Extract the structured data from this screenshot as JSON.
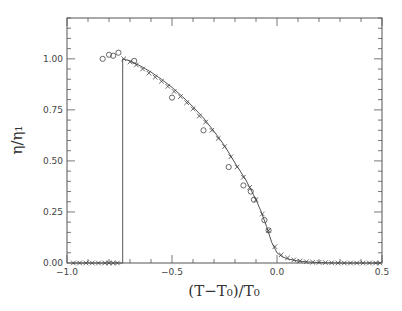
{
  "chart_data": {
    "type": "scatter",
    "title": "",
    "xlabel": "(T−T₀)/T₀",
    "ylabel": "η/η₁",
    "xlim": [
      -1.0,
      0.5
    ],
    "ylim": [
      0.0,
      1.2
    ],
    "grid": false,
    "x_ticks": [
      -1.0,
      -0.5,
      0.0,
      0.5
    ],
    "x_tick_labels": [
      "−1.0",
      "−0.5",
      "0.0",
      "0.5"
    ],
    "y_ticks": [
      0.0,
      0.25,
      0.5,
      0.75,
      1.0
    ],
    "y_tick_labels": [
      "0.00",
      "0.25",
      "0.50",
      "0.75",
      "1.00"
    ],
    "series": [
      {
        "name": "theory (line)",
        "style": "line",
        "x": [
          -0.97,
          -0.735,
          -0.735,
          -0.7,
          -0.65,
          -0.6,
          -0.55,
          -0.5,
          -0.45,
          -0.4,
          -0.35,
          -0.3,
          -0.25,
          -0.2,
          -0.15,
          -0.1,
          -0.075,
          -0.05,
          -0.025,
          0.0,
          0.025,
          0.05,
          0.1,
          0.15,
          0.2,
          0.3,
          0.4,
          0.49
        ],
        "y": [
          0.0,
          0.0,
          1.0,
          0.99,
          0.965,
          0.935,
          0.9,
          0.86,
          0.815,
          0.765,
          0.71,
          0.645,
          0.575,
          0.49,
          0.41,
          0.31,
          0.25,
          0.18,
          0.1,
          0.05,
          0.03,
          0.02,
          0.01,
          0.005,
          0.002,
          0.0,
          0.0,
          0.0
        ]
      },
      {
        "name": "simulation (crosses)",
        "style": "x",
        "x": [
          -0.97,
          -0.94,
          -0.91,
          -0.88,
          -0.85,
          -0.82,
          -0.8,
          -0.78,
          -0.76,
          -0.73,
          -0.7,
          -0.67,
          -0.64,
          -0.61,
          -0.58,
          -0.55,
          -0.52,
          -0.49,
          -0.46,
          -0.43,
          -0.4,
          -0.37,
          -0.34,
          -0.31,
          -0.28,
          -0.25,
          -0.22,
          -0.19,
          -0.16,
          -0.13,
          -0.1,
          -0.07,
          -0.04,
          -0.01,
          0.02,
          0.05,
          0.08,
          0.11,
          0.14,
          0.17,
          0.2,
          0.23,
          0.26,
          0.29,
          0.32,
          0.35,
          0.38,
          0.41,
          0.44,
          0.47,
          0.49
        ],
        "y": [
          0.0,
          0.0,
          0.0,
          0.0,
          0.0,
          0.0,
          0.0,
          0.0,
          0.0,
          1.0,
          0.985,
          0.97,
          0.95,
          0.93,
          0.91,
          0.89,
          0.865,
          0.84,
          0.815,
          0.785,
          0.755,
          0.72,
          0.69,
          0.65,
          0.61,
          0.57,
          0.52,
          0.47,
          0.42,
          0.37,
          0.31,
          0.24,
          0.16,
          0.08,
          0.04,
          0.025,
          0.015,
          0.01,
          0.006,
          0.004,
          0.003,
          0.002,
          0.001,
          0.0,
          0.0,
          0.0,
          0.0,
          0.0,
          0.0,
          0.0,
          0.0
        ]
      },
      {
        "name": "experiment (circles)",
        "style": "o",
        "x": [
          -0.83,
          -0.8,
          -0.78,
          -0.755,
          -0.68,
          -0.5,
          -0.35,
          -0.23,
          -0.16,
          -0.125,
          -0.11,
          -0.06,
          -0.04
        ],
        "y": [
          1.0,
          1.02,
          1.015,
          1.03,
          0.99,
          0.81,
          0.65,
          0.47,
          0.38,
          0.35,
          0.31,
          0.21,
          0.16
        ]
      }
    ],
    "legend": null
  },
  "style": {
    "frame_color": "#555555",
    "line_color": "#555555",
    "marker_color": "#444444"
  }
}
